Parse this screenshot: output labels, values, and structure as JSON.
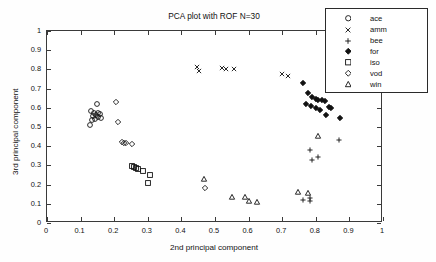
{
  "chart_data": {
    "type": "scatter",
    "title": "PCA plot with ROF N=30",
    "xlabel": "2nd principal component",
    "ylabel": "3rd principal component",
    "xlim": [
      0,
      1
    ],
    "ylim": [
      0,
      1
    ],
    "xticks": [
      "0",
      "0.1",
      "0.2",
      "0.3",
      "0.4",
      "0.5",
      "0.6",
      "0.7",
      "0.8",
      "0.9",
      "1"
    ],
    "yticks": [
      "0",
      "0.1",
      "0.2",
      "0.3",
      "0.4",
      "0.5",
      "0.6",
      "0.7",
      "0.8",
      "0.9",
      "1"
    ],
    "grid": false,
    "annotation": "CPM = 0,928",
    "legend_position": "top-right",
    "series": [
      {
        "name": "ace",
        "marker": "circle",
        "filled": false,
        "points": [
          [
            0.148,
            0.62
          ],
          [
            0.132,
            0.583
          ],
          [
            0.14,
            0.575
          ],
          [
            0.152,
            0.572
          ],
          [
            0.158,
            0.566
          ],
          [
            0.145,
            0.56
          ],
          [
            0.136,
            0.556
          ],
          [
            0.151,
            0.551
          ],
          [
            0.16,
            0.548
          ],
          [
            0.142,
            0.541
          ],
          [
            0.133,
            0.536
          ],
          [
            0.128,
            0.508
          ]
        ]
      },
      {
        "name": "amm",
        "marker": "x",
        "filled": false,
        "points": [
          [
            0.445,
            0.81
          ],
          [
            0.452,
            0.792
          ],
          [
            0.52,
            0.805
          ],
          [
            0.533,
            0.8
          ],
          [
            0.558,
            0.802
          ],
          [
            0.7,
            0.775
          ],
          [
            0.716,
            0.768
          ]
        ]
      },
      {
        "name": "bee",
        "marker": "plus",
        "filled": false,
        "points": [
          [
            0.783,
            0.38
          ],
          [
            0.79,
            0.33
          ],
          [
            0.806,
            0.345
          ],
          [
            0.762,
            0.122
          ],
          [
            0.782,
            0.13
          ],
          [
            0.784,
            0.112
          ],
          [
            0.868,
            0.432
          ]
        ]
      },
      {
        "name": "for",
        "marker": "diamond",
        "filled": true,
        "points": [
          [
            0.762,
            0.728
          ],
          [
            0.776,
            0.678
          ],
          [
            0.79,
            0.655
          ],
          [
            0.8,
            0.648
          ],
          [
            0.808,
            0.64
          ],
          [
            0.77,
            0.622
          ],
          [
            0.786,
            0.608
          ],
          [
            0.8,
            0.6
          ],
          [
            0.818,
            0.642
          ],
          [
            0.826,
            0.636
          ],
          [
            0.812,
            0.588
          ],
          [
            0.838,
            0.604
          ],
          [
            0.846,
            0.6
          ],
          [
            0.83,
            0.562
          ],
          [
            0.872,
            0.548
          ]
        ]
      },
      {
        "name": "iso",
        "marker": "square",
        "filled": false,
        "points": [
          [
            0.252,
            0.296
          ],
          [
            0.258,
            0.29
          ],
          [
            0.264,
            0.286
          ],
          [
            0.272,
            0.281
          ],
          [
            0.286,
            0.272
          ],
          [
            0.308,
            0.248
          ],
          [
            0.302,
            0.206
          ]
        ]
      },
      {
        "name": "vod",
        "marker": "diamond",
        "filled": false,
        "points": [
          [
            0.206,
            0.63
          ],
          [
            0.212,
            0.527
          ],
          [
            0.222,
            0.42
          ],
          [
            0.23,
            0.418
          ],
          [
            0.236,
            0.415
          ],
          [
            0.252,
            0.412
          ],
          [
            0.47,
            0.18
          ]
        ]
      },
      {
        "name": "win",
        "marker": "triangle",
        "filled": false,
        "points": [
          [
            0.468,
            0.228
          ],
          [
            0.552,
            0.138
          ],
          [
            0.588,
            0.136
          ],
          [
            0.6,
            0.112
          ],
          [
            0.626,
            0.11
          ],
          [
            0.806,
            0.452
          ],
          [
            0.748,
            0.16
          ],
          [
            0.776,
            0.158
          ]
        ]
      }
    ]
  },
  "legend": {
    "entries": [
      {
        "label": "ace",
        "marker": "circle-marker"
      },
      {
        "label": "amm",
        "marker": "x-marker"
      },
      {
        "label": "bee",
        "marker": "plus-marker"
      },
      {
        "label": "for",
        "marker": "filled-diamond-marker"
      },
      {
        "label": "iso",
        "marker": "square-marker"
      },
      {
        "label": "vod",
        "marker": "diamond-marker"
      },
      {
        "label": "win",
        "marker": "triangle-marker"
      }
    ]
  },
  "colors": {
    "axis": "#3a3a3a",
    "marker": "#111111",
    "background": "#ffffff"
  }
}
